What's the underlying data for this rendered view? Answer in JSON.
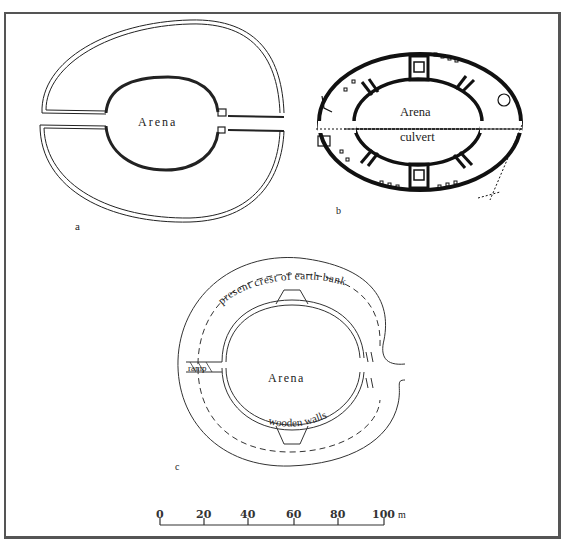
{
  "figure": {
    "panels": [
      {
        "id": "a",
        "label": "a",
        "arena_label": "Arena"
      },
      {
        "id": "b",
        "label": "b",
        "arena_label": "Arena",
        "feature_label": "culvert"
      },
      {
        "id": "c",
        "label": "c",
        "arena_label": "Arena",
        "annotations": [
          "present crest of earth bank",
          "wooden walls",
          "ramp"
        ]
      }
    ],
    "scale_bar": {
      "ticks": [
        "0",
        "20",
        "40",
        "60",
        "80",
        "100"
      ],
      "unit": "m"
    }
  },
  "colors": {
    "ink": "#1a1a1a",
    "frame": "#555555",
    "background": "#ffffff"
  }
}
